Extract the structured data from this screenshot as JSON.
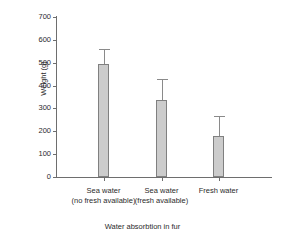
{
  "chart_data": {
    "type": "bar",
    "title": "",
    "xlabel": "Water absorbtion in fur",
    "ylabel": "Weight (g)",
    "ylim": [
      0,
      700
    ],
    "ytick_step": 100,
    "yticks": [
      0,
      100,
      200,
      300,
      400,
      500,
      600,
      700
    ],
    "ytick_labels": [
      "0",
      "100",
      "200",
      "300",
      "400",
      "500",
      "600",
      "700"
    ],
    "grid": false,
    "legend": false,
    "bar_color": "#cccccc",
    "bar_edge_color": "#808080",
    "error_bar_color": "#8a8a8a",
    "axis_color": "#6e6e6e",
    "categories": [
      "Sea water (no fresh available)",
      "Sea water (fresh available)",
      "Fresh water"
    ],
    "category_lines": [
      {
        "line1": "Sea water",
        "line2": "(no fresh available)"
      },
      {
        "line1": "Sea water",
        "line2": "(fresh available)"
      },
      {
        "line1": "Fresh water",
        "line2": ""
      }
    ],
    "values": [
      495,
      335,
      180
    ],
    "errors_upper": [
      65,
      95,
      85
    ],
    "error_tops": [
      560,
      430,
      265
    ]
  }
}
